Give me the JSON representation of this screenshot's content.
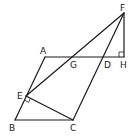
{
  "diagram": {
    "type": "geometry",
    "points": {
      "A": {
        "label": "A",
        "x": 45,
        "y": 57
      },
      "B": {
        "label": "B",
        "x": 15,
        "y": 120
      },
      "C": {
        "label": "C",
        "x": 73,
        "y": 120
      },
      "D": {
        "label": "D",
        "x": 103,
        "y": 57
      },
      "E": {
        "label": "E",
        "x": 26,
        "y": 96
      },
      "F": {
        "label": "F",
        "x": 124,
        "y": 13
      },
      "G": {
        "label": "G",
        "x": 73,
        "y": 57
      },
      "H": {
        "label": "H",
        "x": 124,
        "y": 57
      }
    },
    "segments": [
      "AB",
      "BC",
      "CF",
      "AH",
      "FH",
      "FE",
      "EC"
    ],
    "right_angles": [
      "E (between AB and EC)",
      "H (between FH and AH)"
    ],
    "line_color": "#1a1a1a"
  }
}
